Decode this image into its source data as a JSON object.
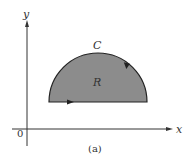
{
  "diagram": {
    "axes": {
      "x_label": "x",
      "y_label": "y",
      "origin_label": "0"
    },
    "region_label": "R",
    "curve_label": "C",
    "caption": "(a)",
    "colors": {
      "region_fill": "#8c8c8c",
      "stroke": "#222222",
      "axis": "#333333"
    },
    "shape": "upper half-disk above horizontal segment, counterclockwise orientation"
  }
}
